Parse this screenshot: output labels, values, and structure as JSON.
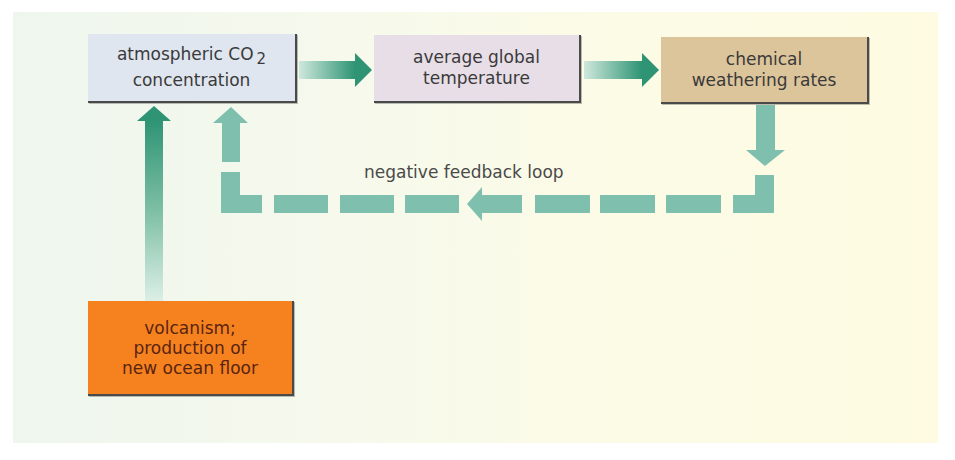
{
  "diagram": {
    "nodes": {
      "co2": {
        "line1": "atmospheric CO",
        "subscript": "2",
        "line2": "concentration",
        "color": "#dfe6ef"
      },
      "temperature": {
        "line1": "average global",
        "line2": "temperature",
        "color": "#e7dee7"
      },
      "weathering": {
        "line1": "chemical",
        "line2": "weathering rates",
        "color": "#dcc49b"
      },
      "volcanism": {
        "line1": "volcanism;",
        "line2": "production of",
        "line3": "new ocean floor",
        "color": "#f5821f"
      }
    },
    "loop_label": "negative feedback loop",
    "edges": [
      {
        "from": "atmospheric CO2 concentration",
        "to": "average global temperature",
        "style": "solid"
      },
      {
        "from": "average global temperature",
        "to": "chemical weathering rates",
        "style": "solid"
      },
      {
        "from": "chemical weathering rates",
        "to": "atmospheric CO2 concentration",
        "style": "dashed",
        "label": "negative feedback loop"
      },
      {
        "from": "volcanism; production of new ocean floor",
        "to": "atmospheric CO2 concentration",
        "style": "solid"
      }
    ],
    "colors": {
      "arrow_dark": "#2e9474",
      "arrow_light": "#7fbfae",
      "arrow_fade": "#d6ece2"
    }
  }
}
